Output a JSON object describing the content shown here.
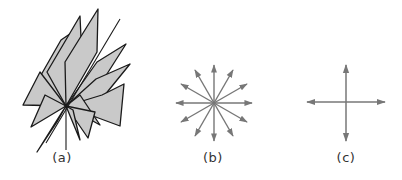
{
  "figure": {
    "panels": [
      {
        "id": "a",
        "label": "(a)",
        "description": "many planes intersecting along a common line through a point",
        "label_x": 62
      },
      {
        "id": "b",
        "label": "(b)",
        "description": "twelve arrows radiating from a point",
        "label_x": 213
      },
      {
        "id": "c",
        "label": "(c)",
        "description": "four arrows in a cross (horizontal and vertical axes)",
        "label_x": 346
      }
    ],
    "colors": {
      "plane_fill": "#c9c9c9",
      "plane_stroke": "#1a1a1a",
      "arrow": "#777777",
      "label": "#333333"
    }
  }
}
